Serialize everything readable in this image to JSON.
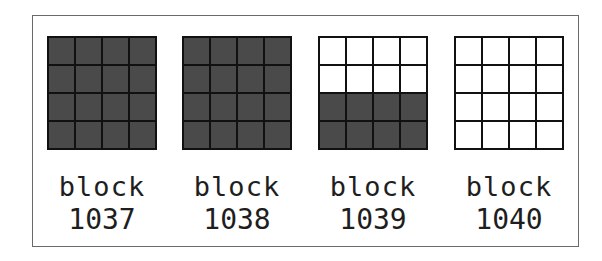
{
  "diagram": {
    "grid_rows": 4,
    "grid_cols": 4,
    "colors": {
      "filled": "#4a4a4a",
      "empty": "#ffffff",
      "lines": "#111111",
      "frame": "#6a6a6a"
    },
    "blocks": [
      {
        "word": "block",
        "number": "1037",
        "filled_rows": 4
      },
      {
        "word": "block",
        "number": "1038",
        "filled_rows": 4
      },
      {
        "word": "block",
        "number": "1039",
        "filled_rows": 2
      },
      {
        "word": "block",
        "number": "1040",
        "filled_rows": 0
      }
    ]
  }
}
